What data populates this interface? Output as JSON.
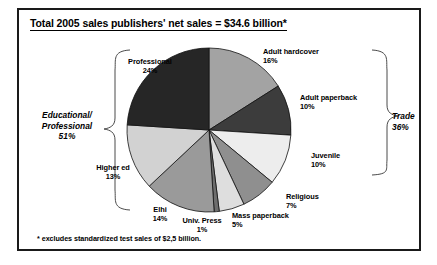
{
  "figure": {
    "title": "Total 2005 sales publishers' net sales = $34.6 billion*",
    "footnote": "* excludes standardized test sales of $2,5 billion."
  },
  "groups": {
    "left": {
      "line1": "Educational/",
      "line2": "Professional",
      "pct": "51%"
    },
    "right": {
      "line1": "Trade",
      "pct": "36%"
    }
  },
  "chart_data": {
    "type": "pie",
    "title": "Total 2005 sales publishers' net sales = $34.6 billion*",
    "subtitle": "",
    "xlabel": "",
    "ylabel": "",
    "units": "percent of net sales",
    "total_label": "$34.6 billion",
    "footnote": "* excludes standardized test sales of $2,5 billion.",
    "start_angle_deg": 0,
    "direction": "clockwise",
    "legend": "none (direct labels)",
    "grid": false,
    "labels": [
      "Adult hardcover",
      "Adult paperback",
      "Juvenile",
      "Religious",
      "Mass paperback",
      "Univ. Press",
      "Elhi",
      "Higher ed",
      "Professional"
    ],
    "values": [
      16,
      10,
      10,
      7,
      5,
      1,
      14,
      13,
      24
    ],
    "value_labels": [
      "16%",
      "10%",
      "10%",
      "7%",
      "5%",
      "1%",
      "14%",
      "13%",
      "24%"
    ],
    "colors": [
      "#a3a3a3",
      "#3c3c3c",
      "#ededed",
      "#8f8f8f",
      "#dedede",
      "#6e6e6e",
      "#9a9a9a",
      "#d2d2d2",
      "#262626"
    ],
    "groupings": [
      {
        "name": "Trade",
        "pct": 36,
        "label": "Trade",
        "value_label": "36%",
        "members": [
          "Adult hardcover",
          "Adult paperback",
          "Juvenile",
          "Religious",
          "Mass paperback"
        ]
      },
      {
        "name": "Educational/Professional",
        "pct": 51,
        "label": "Educational/ Professional",
        "value_label": "51%",
        "members": [
          "Univ. Press",
          "Elhi",
          "Higher ed",
          "Professional"
        ]
      }
    ]
  }
}
